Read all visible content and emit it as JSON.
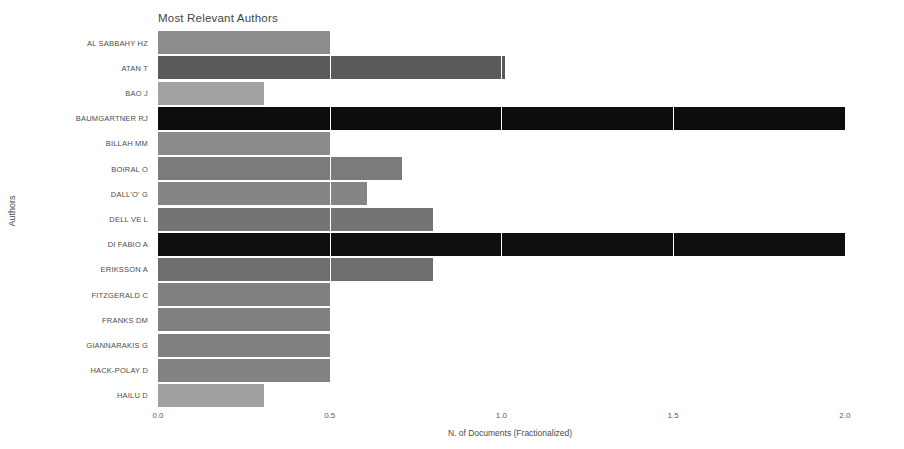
{
  "chart_data": {
    "type": "bar",
    "orientation": "horizontal",
    "title": "Most Relevant Authors",
    "xlabel": "N. of Documents (Fractionalized)",
    "ylabel": "Authors",
    "xlim": [
      0.0,
      2.05
    ],
    "xticks": [
      "0.0",
      "0.5",
      "1.0",
      "1.5",
      "2.0"
    ],
    "xtick_values": [
      0.0,
      0.5,
      1.0,
      1.5,
      2.0
    ],
    "grid": true,
    "legend": "none",
    "categories": [
      "AL SABBAHY HZ",
      "ATAN T",
      "BAO J",
      "BAUMGARTNER RJ",
      "BILLAH MM",
      "BOIRAL O",
      "DALL'O' G",
      "DELL VE L",
      "DI FABIO A",
      "ERIKSSON A",
      "FITZGERALD C",
      "FRANKS DM",
      "GIANNARAKIS G",
      "HACK-POLAY D",
      "HAILU D"
    ],
    "values": [
      0.5,
      1.01,
      0.31,
      2.0,
      0.5,
      0.71,
      0.61,
      0.8,
      2.0,
      0.8,
      0.5,
      0.5,
      0.5,
      0.5,
      0.31
    ],
    "bar_colors": [
      "#8d8d8d",
      "#5a5a5a",
      "#a2a2a2",
      "#0d0d0d",
      "#8b8b8b",
      "#7b7b7b",
      "#858585",
      "#747474",
      "#0f0f0f",
      "#6e6e6e",
      "#808080",
      "#808080",
      "#808080",
      "#828282",
      "#a0a0a0"
    ],
    "background_color": "#ffffff",
    "gridline_color": "#ffffff"
  }
}
